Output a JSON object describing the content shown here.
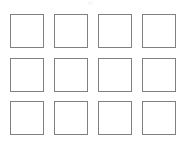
{
  "canvas": {
    "width": 184,
    "height": 141,
    "background_color": "#ffffff"
  },
  "grid": {
    "name": "empty-square-grid",
    "columns": 4,
    "rows": 3,
    "total_cells": 12,
    "cell_width": 34,
    "cell_height": 34,
    "column_gap": 10,
    "row_gap": 10,
    "origin_x": 10,
    "origin_y": 14,
    "cell_border_color": "#808080",
    "cell_border_width": 1.5,
    "cell_fill_color": "#ffffff",
    "cells": [
      {
        "id": "cell-r1-c1",
        "row": 1,
        "col": 1,
        "label": ""
      },
      {
        "id": "cell-r1-c2",
        "row": 1,
        "col": 2,
        "label": ""
      },
      {
        "id": "cell-r1-c3",
        "row": 1,
        "col": 3,
        "label": ""
      },
      {
        "id": "cell-r1-c4",
        "row": 1,
        "col": 4,
        "label": ""
      },
      {
        "id": "cell-r2-c1",
        "row": 2,
        "col": 1,
        "label": ""
      },
      {
        "id": "cell-r2-c2",
        "row": 2,
        "col": 2,
        "label": ""
      },
      {
        "id": "cell-r2-c3",
        "row": 2,
        "col": 3,
        "label": ""
      },
      {
        "id": "cell-r2-c4",
        "row": 2,
        "col": 4,
        "label": ""
      },
      {
        "id": "cell-r3-c1",
        "row": 3,
        "col": 1,
        "label": ""
      },
      {
        "id": "cell-r3-c2",
        "row": 3,
        "col": 2,
        "label": ""
      },
      {
        "id": "cell-r3-c3",
        "row": 3,
        "col": 3,
        "label": ""
      },
      {
        "id": "cell-r3-c4",
        "row": 3,
        "col": 4,
        "label": ""
      }
    ]
  }
}
